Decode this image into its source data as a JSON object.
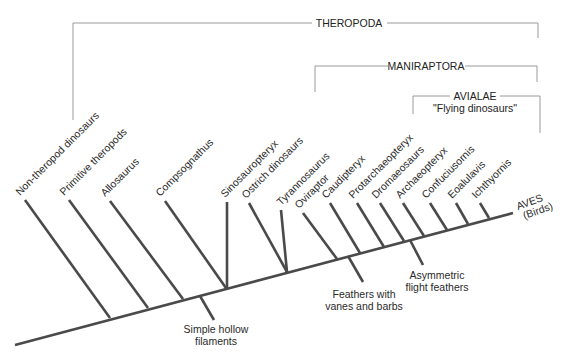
{
  "diagram": {
    "type": "cladogram",
    "colors": {
      "branch": "#4a4a4a",
      "bracket": "#9a9a9a",
      "text": "#2a2a2a",
      "background": "#ffffff"
    },
    "clades": [
      {
        "name": "THEROPODA",
        "subtitle": ""
      },
      {
        "name": "MANIRAPTORA",
        "subtitle": ""
      },
      {
        "name": "AVIALAE",
        "subtitle": "\"Flying dinosaurs\""
      }
    ],
    "taxa": [
      "Non-theropod dinosaurs",
      "Primitive theropods",
      "Allosaurus",
      "Compsognathus",
      "Sinosauropteryx",
      "Ostrich dinosaurs",
      "Tyrannosaurus",
      "Oviraptor",
      "Caudipteryx",
      "Protarchaeopteryx",
      "Dromaeosaurs",
      "Archaeopteryx",
      "Confuciusornis",
      "Eoalulavis",
      "Ichthyornis"
    ],
    "terminal": {
      "line1": "AVES",
      "line2": "(Birds)"
    },
    "traits": [
      {
        "line1": "Simple hollow",
        "line2": "filaments"
      },
      {
        "line1": "Feathers with",
        "line2": "vanes and barbs"
      },
      {
        "line1": "Asymmetric",
        "line2": "flight feathers"
      }
    ]
  }
}
